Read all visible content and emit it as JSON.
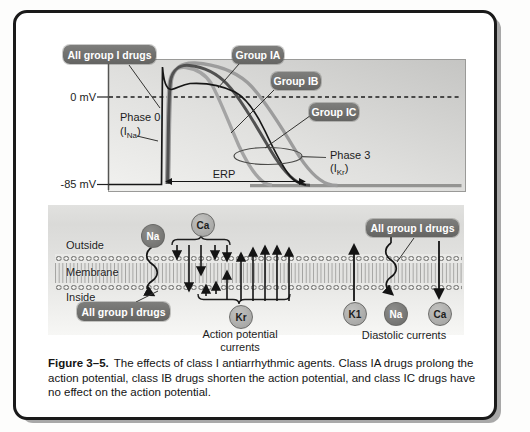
{
  "graph": {
    "drug_labels": {
      "all_group": "All group I drugs",
      "group_ia": "Group IA",
      "group_ib": "Group IB",
      "group_ic": "Group IC"
    },
    "axis": {
      "zero": "0 mV",
      "rest": "-85 mV"
    },
    "annotations": {
      "phase0": "Phase 0",
      "phase0_current": {
        "open": "(I",
        "sub": "Na",
        "close": ")"
      },
      "phase3": "Phase 3",
      "phase3_current": {
        "open": "(I",
        "sub": "Kr",
        "close": ")"
      },
      "erp": "ERP"
    }
  },
  "membrane": {
    "layers": {
      "outside": "Outside",
      "membrane": "Membrane",
      "inside": "Inside"
    },
    "drug_labels": {
      "left": "All group I drugs",
      "right": "All group I drugs"
    },
    "ions": {
      "na_left": "Na",
      "ca_top": "Ca",
      "kr": "Kr",
      "k1": "K1",
      "na_right": "Na",
      "ca_right": "Ca"
    },
    "captions": {
      "action_potential_line1": "Action potential",
      "action_potential_line2": "currents",
      "diastolic": "Diastolic currents"
    }
  },
  "figure_caption": {
    "title": "Figure 3–5.",
    "body": "The effects of class I antiarrhythmic agents. Class IA drugs prolong the action potential, class IB drugs shorten the action potential, and class IC drugs have no effect on the action potential."
  },
  "colors": {
    "curve_control": "#161616",
    "curve_group_ia": "#9c9c9c",
    "curve_group_ib": "#a4a4a4",
    "curve_group_ic": "#515151",
    "label_box_bg": "#6f6f6d",
    "ion_dark": "#767674",
    "ion_light": "#adadab",
    "panel_border": "#1a1a1a"
  }
}
